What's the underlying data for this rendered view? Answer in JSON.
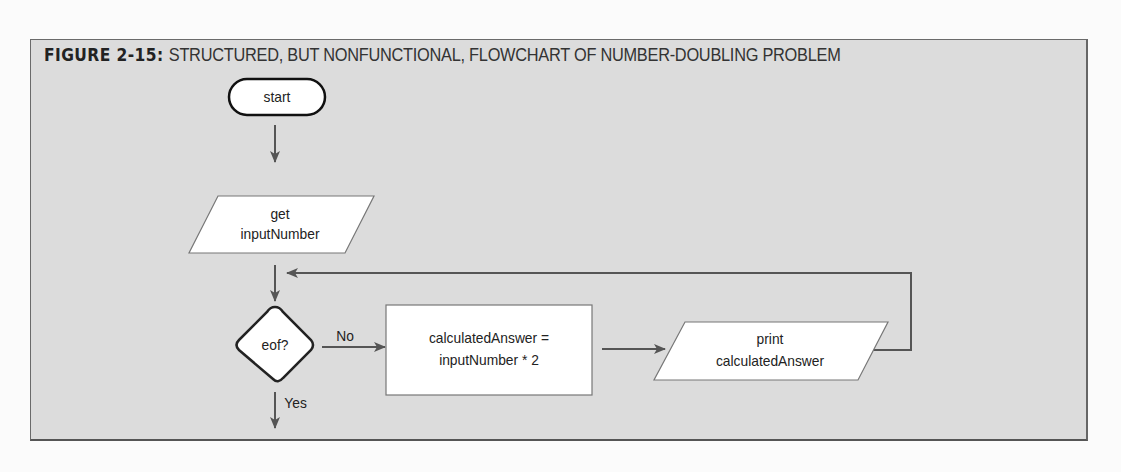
{
  "figure": {
    "label": "FIGURE 2-15:",
    "caption": "STRUCTURED, BUT NONFUNCTIONAL, FLOWCHART OF NUMBER-DOUBLING PROBLEM"
  },
  "flowchart": {
    "nodes": [
      {
        "id": "start",
        "shape": "terminator",
        "text": [
          "start"
        ]
      },
      {
        "id": "input",
        "shape": "parallelogram",
        "text": [
          "get",
          "inputNumber"
        ]
      },
      {
        "id": "decision",
        "shape": "diamond",
        "text": [
          "eof?"
        ]
      },
      {
        "id": "process",
        "shape": "rectangle",
        "text": [
          "calculatedAnswer =",
          "inputNumber * 2"
        ]
      },
      {
        "id": "output",
        "shape": "parallelogram",
        "text": [
          "print",
          "calculatedAnswer"
        ]
      }
    ],
    "edges": [
      {
        "from": "start",
        "to": "input",
        "label": ""
      },
      {
        "from": "input",
        "to": "decision",
        "label": ""
      },
      {
        "from": "decision",
        "to": "process",
        "label": "No"
      },
      {
        "from": "process",
        "to": "output",
        "label": ""
      },
      {
        "from": "output",
        "to": "decision",
        "label": "",
        "note": "loop back above decision"
      },
      {
        "from": "decision",
        "to": "end",
        "label": "Yes"
      }
    ],
    "labels": {
      "start": "start",
      "input_line1": "get",
      "input_line2": "inputNumber",
      "decision": "eof?",
      "no": "No",
      "yes": "Yes",
      "process_line1": "calculatedAnswer =",
      "process_line2": "inputNumber * 2",
      "output_line1": "print",
      "output_line2": "calculatedAnswer"
    }
  },
  "colors": {
    "panel_bg": "#dcdcdc",
    "shape_fill": "#ffffff",
    "line": "#555555",
    "text": "#222222"
  }
}
